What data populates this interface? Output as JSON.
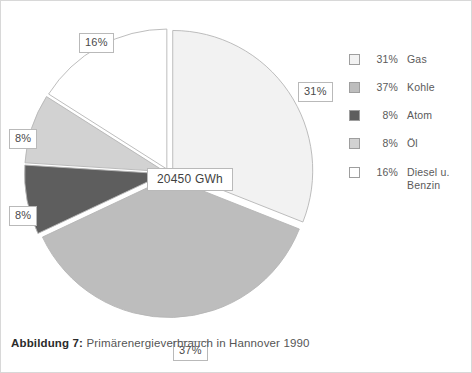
{
  "figure": {
    "caption_bold": "Abbildung 7:",
    "caption_rest": " Primärenergieverbrauch in Hannover 1990"
  },
  "center_callout": "20450 GWh",
  "callouts": {
    "diesel": "16%",
    "gas": "31%",
    "ol": "8%",
    "atom": "8%",
    "kohle": "37%"
  },
  "legend": {
    "items": [
      {
        "pct": "31%",
        "label": "Gas",
        "color": "#f2f2f2"
      },
      {
        "pct": "37%",
        "label": "Kohle",
        "color": "#bdbdbd"
      },
      {
        "pct": "8%",
        "label": "Atom",
        "color": "#5e5e5e"
      },
      {
        "pct": "8%",
        "label": "Öl",
        "color": "#d2d2d2"
      },
      {
        "pct": "16%",
        "label": "Diesel u. Benzin",
        "color": "#ffffff"
      }
    ]
  },
  "chart_data": {
    "type": "pie",
    "title": "Primärenergieverbrauch in Hannover 1990",
    "center_label": "20450 GWh",
    "total": 20450,
    "unit": "GWh",
    "categories": [
      "Gas",
      "Kohle",
      "Atom",
      "Öl",
      "Diesel u. Benzin"
    ],
    "values": [
      31,
      37,
      8,
      8,
      16
    ],
    "value_labels": [
      "31%",
      "37%",
      "8%",
      "8%",
      "16%"
    ],
    "colors": [
      "#f2f2f2",
      "#bdbdbd",
      "#5e5e5e",
      "#d2d2d2",
      "#ffffff"
    ],
    "exploded": [
      true,
      true,
      true,
      true,
      true
    ],
    "start_angle_deg": 0,
    "direction": "clockwise",
    "legend_position": "right",
    "grid": false
  }
}
